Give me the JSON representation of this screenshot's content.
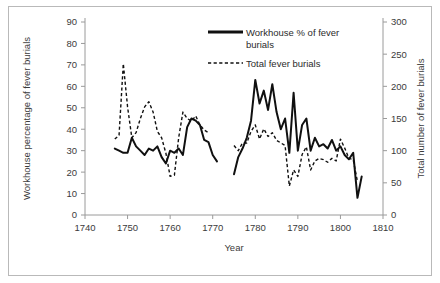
{
  "chart_data": {
    "type": "line",
    "title": "",
    "xlabel": "Year",
    "ylabel": "Workhouse percentage of fever burials",
    "y2label": "Total number of fever burials",
    "xlim": [
      1740,
      1810
    ],
    "ylim": [
      0,
      90
    ],
    "y2lim": [
      0,
      300
    ],
    "xticks": [
      1740,
      1750,
      1760,
      1770,
      1780,
      1790,
      1800,
      1810
    ],
    "yticks": [
      0,
      10,
      20,
      30,
      40,
      50,
      60,
      70,
      80,
      90
    ],
    "y2ticks": [
      0,
      50,
      100,
      150,
      200,
      250,
      300
    ],
    "grid": false,
    "legend_position": "top-center",
    "series": [
      {
        "name": "Workhouse % of fever burials",
        "axis": "left",
        "style": "solid",
        "units": "percent",
        "segments": [
          {
            "x": [
              1747,
              1748,
              1749,
              1750,
              1751,
              1752,
              1753,
              1754,
              1755,
              1756,
              1757,
              1758,
              1759,
              1760,
              1761,
              1762,
              1763,
              1764,
              1765,
              1766,
              1767,
              1768,
              1769,
              1770,
              1771
            ],
            "y": [
              31,
              30,
              29,
              29,
              36,
              32,
              30,
              28,
              31,
              30,
              32,
              27,
              24,
              30,
              29,
              31,
              28,
              41,
              45,
              44,
              42,
              35,
              34,
              28,
              25
            ]
          },
          {
            "x": [
              1775,
              1776,
              1777,
              1778,
              1779,
              1780,
              1781,
              1782,
              1783,
              1784,
              1785,
              1786,
              1787,
              1788,
              1789,
              1790,
              1791,
              1792,
              1793,
              1794,
              1795,
              1796,
              1797,
              1798,
              1799,
              1800,
              1801,
              1802,
              1803,
              1804,
              1805
            ],
            "y": [
              19,
              27,
              31,
              36,
              44,
              63,
              52,
              58,
              49,
              61,
              48,
              40,
              45,
              29,
              57,
              30,
              42,
              45,
              30,
              36,
              32,
              33,
              31,
              35,
              30,
              32,
              28,
              26,
              29,
              8,
              18
            ]
          }
        ]
      },
      {
        "name": "Total fever burials",
        "axis": "right",
        "style": "dashed",
        "units": "count",
        "segments": [
          {
            "x": [
              1747,
              1748,
              1749,
              1750,
              1751,
              1752,
              1753,
              1754,
              1755,
              1756,
              1757,
              1758,
              1759,
              1760,
              1761,
              1762,
              1763,
              1764,
              1765,
              1766,
              1767,
              1768,
              1769
            ],
            "y": [
              118,
              124,
              235,
              168,
              120,
              128,
              150,
              168,
              176,
              160,
              130,
              120,
              96,
              60,
              62,
              120,
              160,
              150,
              146,
              154,
              140,
              132,
              128
            ]
          },
          {
            "x": [
              1775,
              1776,
              1777,
              1778,
              1779,
              1780,
              1781,
              1782,
              1783,
              1784,
              1785,
              1786,
              1787,
              1788,
              1789,
              1790,
              1791,
              1792,
              1793,
              1794,
              1795,
              1796,
              1797,
              1798,
              1799,
              1800,
              1801,
              1802,
              1803,
              1804
            ],
            "y": [
              108,
              100,
              112,
              112,
              130,
              140,
              118,
              134,
              122,
              128,
              116,
              112,
              108,
              45,
              70,
              60,
              94,
              106,
              70,
              84,
              88,
              86,
              82,
              88,
              84,
              118,
              104,
              88,
              86,
              52
            ]
          }
        ]
      }
    ]
  },
  "legend": {
    "entries": [
      {
        "label": "Workhouse % of fever",
        "label2": "burials",
        "style": "solid"
      },
      {
        "label": "Total fever burials",
        "label2": "",
        "style": "dashed"
      }
    ]
  },
  "axes": {
    "x_title": "Year",
    "y_left_title": "Workhouse percentage of fever burials",
    "y_right_title": "Total number of fever burials",
    "x_tick_labels": [
      "1740",
      "1750",
      "1760",
      "1770",
      "1780",
      "1790",
      "1800",
      "1810"
    ],
    "y_left_tick_labels": [
      "0",
      "10",
      "20",
      "30",
      "40",
      "50",
      "60",
      "70",
      "80",
      "90"
    ],
    "y_right_tick_labels": [
      "0",
      "50",
      "100",
      "150",
      "200",
      "250",
      "300"
    ]
  }
}
